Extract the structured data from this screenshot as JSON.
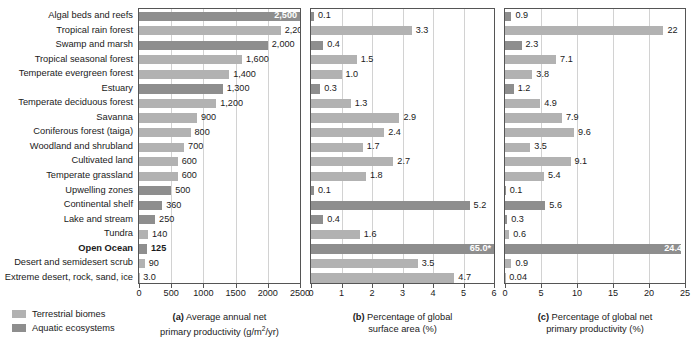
{
  "chart_data": {
    "type": "bar",
    "orientation": "horizontal",
    "grid": true,
    "legend_position": "bottom-left",
    "categories": [
      "Algal beds and reefs",
      "Tropical rain forest",
      "Swamp and marsh",
      "Tropical seasonal forest",
      "Temperate evergreen forest",
      "Estuary",
      "Temperate deciduous forest",
      "Savanna",
      "Coniferous forest (taiga)",
      "Woodland and shrubland",
      "Cultivated land",
      "Temperate grassland",
      "Upwelling zones",
      "Continental shelf",
      "Lake and stream",
      "Tundra",
      "Open Ocean",
      "Desert and semidesert scrub",
      "Extreme desert, rock, sand, ice"
    ],
    "category_types": [
      "aquatic",
      "terrestrial",
      "aquatic",
      "terrestrial",
      "terrestrial",
      "aquatic",
      "terrestrial",
      "terrestrial",
      "terrestrial",
      "terrestrial",
      "terrestrial",
      "terrestrial",
      "aquatic",
      "aquatic",
      "aquatic",
      "terrestrial",
      "aquatic",
      "terrestrial",
      "terrestrial"
    ],
    "highlight_category": "Open Ocean",
    "panels": [
      {
        "id": "a",
        "caption_line1": "(a) Average annual net",
        "caption_line2": "primary productivity (g/m2/yr)",
        "caption_bold_prefix": "(a)",
        "xlabel": "Average annual net primary productivity (g/m2/yr)",
        "xlim": [
          0,
          2500
        ],
        "ticks": [
          0,
          500,
          1000,
          1500,
          2000,
          2500
        ],
        "tick_labels": [
          "0",
          "500",
          "1000",
          "1500",
          "2000",
          "2500"
        ],
        "values": [
          2500,
          2200,
          2000,
          1600,
          1400,
          1300,
          1200,
          900,
          800,
          700,
          600,
          600,
          500,
          360,
          250,
          140,
          125,
          90,
          3.0
        ],
        "value_labels": [
          "2,500",
          "2,200",
          "2,000",
          "1,600",
          "1,400",
          "1,300",
          "1,200",
          "900",
          "800",
          "700",
          "600",
          "600",
          "500",
          "360",
          "250",
          "140",
          "125",
          "90",
          "3.0"
        ],
        "label_inside": [
          true,
          false,
          false,
          false,
          false,
          false,
          false,
          false,
          false,
          false,
          false,
          false,
          false,
          false,
          false,
          false,
          false,
          false,
          false
        ]
      },
      {
        "id": "b",
        "caption_line1": "(b) Percentage of global",
        "caption_line2": "surface area (%)",
        "caption_bold_prefix": "(b)",
        "xlabel": "Percentage of global surface area (%)",
        "xlim": [
          0,
          6
        ],
        "ticks": [
          0,
          1,
          2,
          3,
          4,
          5,
          6
        ],
        "tick_labels": [
          "0",
          "1",
          "2",
          "3",
          "4",
          "5",
          "6"
        ],
        "values": [
          0.1,
          3.3,
          0.4,
          1.5,
          1.0,
          0.3,
          1.3,
          2.9,
          2.4,
          1.7,
          2.7,
          1.8,
          0.1,
          5.2,
          0.4,
          1.6,
          6.0,
          3.5,
          4.7
        ],
        "value_labels": [
          "0.1",
          "3.3",
          "0.4",
          "1.5",
          "1.0",
          "0.3",
          "1.3",
          "2.9",
          "2.4",
          "1.7",
          "2.7",
          "1.8",
          "0.1",
          "5.2",
          "0.4",
          "1.6",
          "65.0*",
          "3.5",
          "4.7"
        ],
        "label_inside": [
          false,
          false,
          false,
          false,
          false,
          false,
          false,
          false,
          false,
          false,
          false,
          false,
          false,
          false,
          false,
          false,
          true,
          false,
          false
        ],
        "note": "Open Ocean bar is truncated to the axis maximum; its true value 65.0% is marked with an asterisk."
      },
      {
        "id": "c",
        "caption_line1": "(c) Percentage of global net",
        "caption_line2": "primary productivity (%)",
        "caption_bold_prefix": "(c)",
        "xlabel": "Percentage of global net primary productivity (%)",
        "xlim": [
          0,
          25
        ],
        "ticks": [
          0,
          5,
          10,
          15,
          20,
          25
        ],
        "tick_labels": [
          "0",
          "5",
          "10",
          "15",
          "20",
          "25"
        ],
        "values": [
          0.9,
          22,
          2.3,
          7.1,
          3.8,
          1.2,
          4.9,
          7.9,
          9.6,
          3.5,
          9.1,
          5.4,
          0.1,
          5.6,
          0.3,
          0.6,
          24.4,
          0.9,
          0.04
        ],
        "value_labels": [
          "0.9",
          "22",
          "2.3",
          "7.1",
          "3.8",
          "1.2",
          "4.9",
          "7.9",
          "9.6",
          "3.5",
          "9.1",
          "5.4",
          "0.1",
          "5.6",
          "0.3",
          "0.6",
          "24.4",
          "0.9",
          "0.04"
        ],
        "label_inside": [
          false,
          false,
          false,
          false,
          false,
          false,
          false,
          false,
          false,
          false,
          false,
          false,
          false,
          false,
          false,
          false,
          true,
          false,
          false
        ]
      }
    ]
  },
  "legend": {
    "items": [
      {
        "label": "Terrestrial biomes",
        "type": "terrestrial",
        "color": "#b2b2b2"
      },
      {
        "label": "Aquatic ecosystems",
        "type": "aquatic",
        "color": "#8e8e8e"
      }
    ]
  },
  "colors": {
    "terrestrial": "#b2b2b2",
    "aquatic": "#8e8e8e",
    "gridline": "#d2d2d2",
    "axis": "#555555",
    "text": "#1a1a1a",
    "background": "#ffffff"
  }
}
